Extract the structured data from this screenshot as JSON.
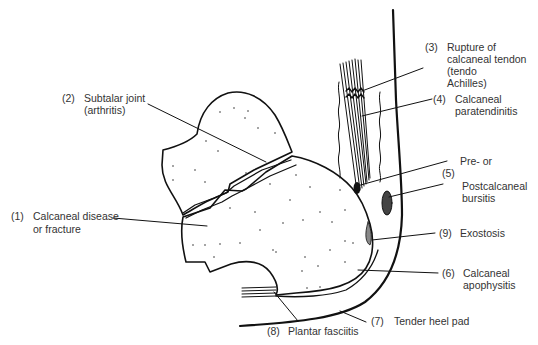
{
  "diagram": {
    "colors": {
      "ink": "#111111",
      "text": "#333333",
      "background": "#ffffff"
    },
    "labels": [
      {
        "id": "1",
        "number": "(1)",
        "lines": [
          "Calcaneal disease",
          "or fracture"
        ]
      },
      {
        "id": "2",
        "number": "(2)",
        "lines": [
          "Subtalar joint",
          "(arthritis)"
        ]
      },
      {
        "id": "3",
        "number": "(3)",
        "lines": [
          "Rupture of",
          "calcaneal tendon",
          "(tendo",
          "Achilles)"
        ]
      },
      {
        "id": "4",
        "number": "(4)",
        "lines": [
          "Calcaneal",
          "paratendinitis"
        ]
      },
      {
        "id": "5",
        "number": "(5)",
        "lines": [
          "Pre-  or",
          "Postcalcaneal",
          "bursitis"
        ]
      },
      {
        "id": "9",
        "number": "(9)",
        "lines": [
          "Exostosis"
        ]
      },
      {
        "id": "6",
        "number": "(6)",
        "lines": [
          "Calcaneal",
          "apophysitis"
        ]
      },
      {
        "id": "7",
        "number": "(7)",
        "lines": [
          "Tender heel pad"
        ]
      },
      {
        "id": "8",
        "number": "(8)",
        "lines": [
          "Plantar fasciitis"
        ]
      }
    ]
  }
}
